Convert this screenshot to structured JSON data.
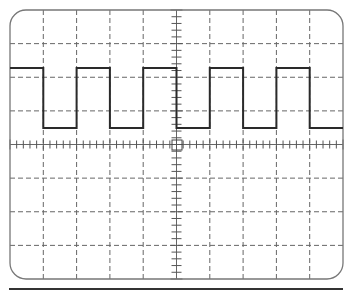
{
  "diagram": {
    "type": "oscilloscope-display",
    "grid": {
      "columns": 10,
      "rows": 8,
      "style": "dashed"
    },
    "center_graticule": {
      "minor_ticks_per_division": 5
    },
    "signal": {
      "shape": "square-wave",
      "cycles_visible": 4.5,
      "duty_cycle": 0.5
    },
    "colors": {
      "frame": "#777777",
      "grid": "#666666",
      "trace": "#2a2a2a",
      "baseline": "#333333"
    }
  }
}
